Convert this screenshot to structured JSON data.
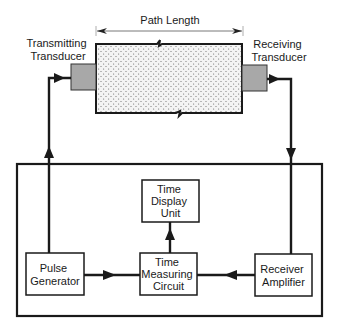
{
  "diagram": {
    "path_length_label": "Path Length",
    "transmitting_transducer": {
      "line1": "Transmitting",
      "line2": "Transducer"
    },
    "receiving_transducer": {
      "line1": "Receiving",
      "line2": "Transducer"
    },
    "blocks": {
      "pulse_generator": {
        "line1": "Pulse",
        "line2": "Generator"
      },
      "time_display_unit": {
        "line1": "Time",
        "line2": "Display",
        "line3": "Unit"
      },
      "time_measuring_circuit": {
        "line1": "Time",
        "line2": "Measuring",
        "line3": "Circuit"
      },
      "receiver_amplifier": {
        "line1": "Receiver",
        "line2": "Amplifier"
      }
    },
    "colors": {
      "line": "#1a1a1a",
      "transducer_fill": "#a8a8a8",
      "specimen_fill": "#f4f4f4",
      "specimen_dots": "#6e6e6e"
    }
  }
}
